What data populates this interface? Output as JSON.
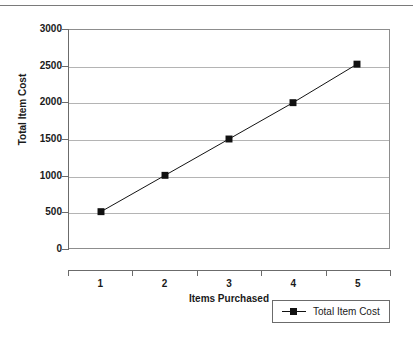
{
  "header": {
    "fragment_text": "........ .... ... ...."
  },
  "chart_data": {
    "type": "line",
    "title": "",
    "xlabel": "Items Purchased",
    "ylabel": "Total Item Cost",
    "categories": [
      "1",
      "2",
      "3",
      "4",
      "5"
    ],
    "series": [
      {
        "name": "Total Item Cost",
        "values": [
          500,
          1000,
          1500,
          2000,
          2530
        ],
        "line_color": "#111111",
        "marker": "square",
        "marker_color": "#111111"
      }
    ],
    "ylim": [
      0,
      3000
    ],
    "yticks": [
      0,
      500,
      1000,
      1500,
      2000,
      2500,
      3000
    ],
    "ytick_labels": [
      "0",
      "500",
      "1000",
      "1500",
      "2000",
      "2500",
      "3000"
    ],
    "grid": true,
    "grid_axis": "y",
    "grid_color": "#b4b4b4",
    "legend_position": "bottom-right",
    "plot_background": "#ffffff",
    "axis_color": "#6b6b6b"
  }
}
